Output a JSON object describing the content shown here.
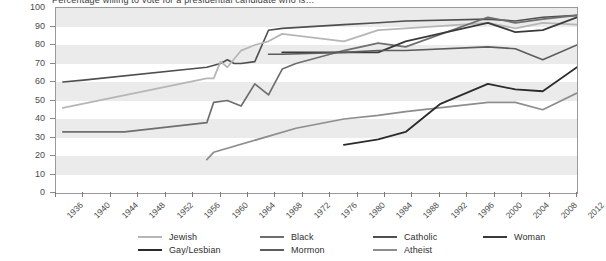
{
  "title_fragment": "Percentage willing to vote for a presidential candidate who is…",
  "chart_data": {
    "type": "line",
    "title": "Percentage willing to vote for a presidential candidate who is…",
    "xlabel": "",
    "ylabel": "",
    "xlim": [
      1936,
      2012
    ],
    "ylim": [
      0,
      100
    ],
    "grid": "horizontal-bands",
    "legend_position": "bottom",
    "x_ticks": [
      1936,
      1940,
      1944,
      1948,
      1952,
      1956,
      1960,
      1964,
      1968,
      1972,
      1976,
      1980,
      1984,
      1988,
      1992,
      1996,
      2000,
      2004,
      2008,
      2012
    ],
    "y_ticks": [
      0,
      10,
      20,
      30,
      40,
      50,
      60,
      70,
      80,
      90,
      100
    ],
    "series": [
      {
        "name": "Catholic",
        "color": "#4f4f4f",
        "width": 1.6,
        "points": [
          [
            1937,
            60
          ],
          [
            1940,
            61
          ],
          [
            1958,
            68
          ],
          [
            1960,
            70
          ],
          [
            1961,
            72
          ],
          [
            1962,
            70
          ],
          [
            1963,
            70
          ],
          [
            1965,
            71
          ],
          [
            1967,
            88
          ],
          [
            1969,
            89
          ],
          [
            1978,
            91
          ],
          [
            1983,
            92
          ],
          [
            1987,
            93
          ],
          [
            1999,
            94
          ],
          [
            2003,
            93
          ],
          [
            2007,
            95
          ],
          [
            2012,
            96
          ]
        ]
      },
      {
        "name": "Jewish",
        "color": "#b6b6b6",
        "width": 1.8,
        "points": [
          [
            1937,
            46
          ],
          [
            1958,
            62
          ],
          [
            1959,
            62
          ],
          [
            1960,
            71
          ],
          [
            1961,
            68
          ],
          [
            1963,
            77
          ],
          [
            1965,
            80
          ],
          [
            1967,
            82
          ],
          [
            1969,
            86
          ],
          [
            1978,
            82
          ],
          [
            1983,
            88
          ],
          [
            1987,
            89
          ],
          [
            1999,
            92
          ],
          [
            2003,
            89
          ],
          [
            2007,
            92
          ],
          [
            2012,
            91
          ]
        ]
      },
      {
        "name": "Black",
        "color": "#6e6e6e",
        "width": 1.7,
        "points": [
          [
            1937,
            33
          ],
          [
            1946,
            33
          ],
          [
            1958,
            38
          ],
          [
            1959,
            49
          ],
          [
            1961,
            50
          ],
          [
            1963,
            47
          ],
          [
            1965,
            59
          ],
          [
            1967,
            53
          ],
          [
            1969,
            67
          ],
          [
            1971,
            70
          ],
          [
            1978,
            77
          ],
          [
            1983,
            81
          ],
          [
            1987,
            79
          ],
          [
            1999,
            95
          ],
          [
            2003,
            92
          ],
          [
            2007,
            94
          ],
          [
            2012,
            96
          ]
        ]
      },
      {
        "name": "Woman",
        "color": "#3a3a3a",
        "width": 1.8,
        "points": [
          [
            1969,
            76
          ],
          [
            1975,
            76
          ],
          [
            1983,
            76
          ],
          [
            1987,
            82
          ],
          [
            1999,
            92
          ],
          [
            2003,
            87
          ],
          [
            2007,
            88
          ],
          [
            2012,
            95
          ]
        ]
      },
      {
        "name": "Mormon",
        "color": "#5c5c5c",
        "width": 1.6,
        "points": [
          [
            1967,
            75
          ],
          [
            1969,
            75
          ],
          [
            1978,
            76
          ],
          [
            1983,
            77
          ],
          [
            1987,
            77
          ],
          [
            1999,
            79
          ],
          [
            2003,
            78
          ],
          [
            2007,
            72
          ],
          [
            2012,
            80
          ]
        ]
      },
      {
        "name": "Atheist",
        "color": "#8d8d8d",
        "width": 1.7,
        "points": [
          [
            1958,
            18
          ],
          [
            1959,
            22
          ],
          [
            1971,
            35
          ],
          [
            1978,
            40
          ],
          [
            1983,
            42
          ],
          [
            1987,
            44
          ],
          [
            1999,
            49
          ],
          [
            2003,
            49
          ],
          [
            2007,
            45
          ],
          [
            2012,
            54
          ]
        ]
      },
      {
        "name": "Gay/Lesbian",
        "color": "#2b2b2b",
        "width": 1.8,
        "points": [
          [
            1978,
            26
          ],
          [
            1983,
            29
          ],
          [
            1987,
            33
          ],
          [
            1992,
            48
          ],
          [
            1999,
            59
          ],
          [
            2003,
            56
          ],
          [
            2007,
            55
          ],
          [
            2012,
            68
          ]
        ]
      }
    ]
  },
  "legend": {
    "columns": [
      {
        "entries": [
          {
            "label": "Jewish",
            "color": "#b6b6b6",
            "width": 2.2
          },
          {
            "label": "Gay/Lesbian",
            "color": "#2b2b2b",
            "width": 2.6
          }
        ]
      },
      {
        "entries": [
          {
            "label": "Black",
            "color": "#6e6e6e",
            "width": 2.4
          },
          {
            "label": "Mormon",
            "color": "#5c5c5c",
            "width": 2.4
          }
        ]
      },
      {
        "entries": [
          {
            "label": "Catholic",
            "color": "#4f4f4f",
            "width": 2.4
          },
          {
            "label": "Atheist",
            "color": "#8d8d8d",
            "width": 2.2
          }
        ]
      },
      {
        "entries": [
          {
            "label": "Woman",
            "color": "#3a3a3a",
            "width": 2.6
          }
        ]
      }
    ]
  }
}
